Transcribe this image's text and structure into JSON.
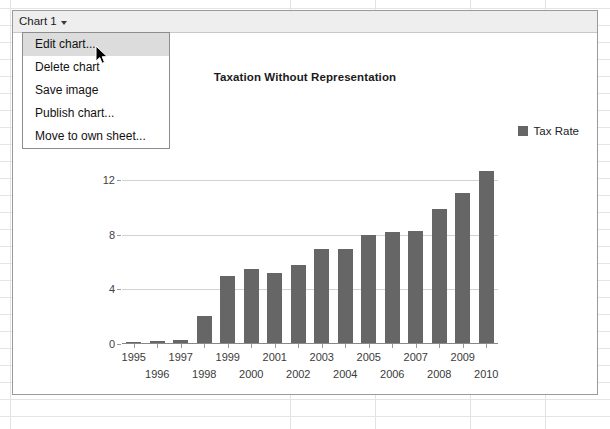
{
  "chart_object": {
    "header": {
      "title": "Chart 1",
      "caret_icon": "chevron-down-icon"
    },
    "menu": {
      "items": [
        {
          "label": "Edit chart...",
          "highlighted": true
        },
        {
          "label": "Delete chart",
          "highlighted": false
        },
        {
          "label": "Save image",
          "highlighted": false
        },
        {
          "label": "Publish chart...",
          "highlighted": false
        },
        {
          "label": "Move to own sheet...",
          "highlighted": false
        }
      ]
    }
  },
  "colors": {
    "bar": "#666666",
    "gridline": "#d2d2d2",
    "header_bg": "#eeeeee",
    "menu_highlight": "#dcdcdc"
  },
  "chart_data": {
    "type": "bar",
    "title": "Taxation Without Representation",
    "xlabel": "",
    "ylabel": "",
    "ylim": [
      0,
      13.6
    ],
    "yticks": [
      0,
      4,
      8,
      12
    ],
    "grid": true,
    "legend_position": "right",
    "legend": [
      "Tax Rate"
    ],
    "categories": [
      "1995",
      "1996",
      "1997",
      "1998",
      "1999",
      "2000",
      "2001",
      "2002",
      "2003",
      "2004",
      "2005",
      "2006",
      "2007",
      "2008",
      "2009",
      "2010"
    ],
    "series": [
      {
        "name": "Tax Rate",
        "values": [
          0.1,
          0.15,
          0.2,
          2.0,
          4.9,
          5.4,
          5.1,
          5.7,
          6.9,
          6.9,
          7.9,
          8.1,
          8.2,
          9.8,
          11.0,
          12.6
        ]
      }
    ]
  }
}
